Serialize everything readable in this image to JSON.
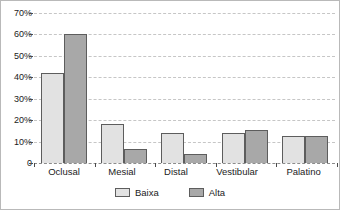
{
  "chart_data": {
    "type": "bar",
    "title": "",
    "subtitle": "",
    "xlabel": "",
    "ylabel": "",
    "categories": [
      "Oclusal",
      "Mesial",
      "Distal",
      "Vestibular",
      "Palatino"
    ],
    "series": [
      {
        "name": "Baixa",
        "color": "#e2e2e2",
        "values": [
          42,
          18,
          14,
          14,
          12.5
        ]
      },
      {
        "name": "Alta",
        "color": "#a8a8a8",
        "values": [
          60,
          6.5,
          4,
          15.5,
          12.5
        ]
      }
    ],
    "ylim": [
      0,
      70
    ],
    "ytick_values": [
      70,
      60,
      50,
      40,
      30,
      20,
      10,
      0
    ],
    "ytick_labels": [
      "70%",
      "60%",
      "50%",
      "40%",
      "30%",
      "20%",
      "10%",
      "0"
    ],
    "grid": true,
    "grid_style": "dashed",
    "grid_color": "#c6c6c6",
    "legend_position": "bottom-center",
    "legend_entries": [
      "Baixa",
      "Alta"
    ],
    "annotations": [],
    "border_color": "#b9b9b9",
    "bar_edge_color": "#5d5d5d",
    "background_color": "#ffffff"
  }
}
